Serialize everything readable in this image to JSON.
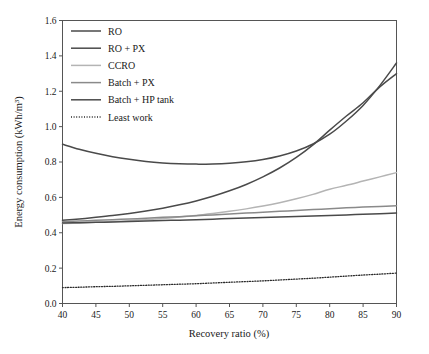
{
  "figure": {
    "background_color": "#ffffff",
    "frame_color": "#555555"
  },
  "chart_data": {
    "type": "line",
    "title": "",
    "xlabel": "Recovery ratio (%)",
    "ylabel": "Energy consumption (kWh/m",
    "ylabel_sup": "3",
    "ylabel_tail": ")",
    "xlim": [
      40,
      90
    ],
    "ylim": [
      0.0,
      1.6
    ],
    "xticks": [
      40,
      45,
      50,
      55,
      60,
      65,
      70,
      75,
      80,
      85,
      90
    ],
    "xtick_labels": [
      "40",
      "45",
      "50",
      "55",
      "60",
      "65",
      "70",
      "75",
      "80",
      "85",
      "90"
    ],
    "yticks": [
      0.0,
      0.2,
      0.4,
      0.6,
      0.8,
      1.0,
      1.2,
      1.4,
      1.6
    ],
    "ytick_labels": [
      "0.0",
      "0.2",
      "0.4",
      "0.6",
      "0.8",
      "1.0",
      "1.2",
      "1.4",
      "1.6"
    ],
    "grid": false,
    "legend_position": "upper-left",
    "x": [
      40,
      42.5,
      45,
      47.5,
      50,
      52.5,
      55,
      57.5,
      60,
      62.5,
      65,
      67.5,
      70,
      72.5,
      75,
      77.5,
      80,
      82.5,
      85,
      87.5,
      90
    ],
    "series": [
      {
        "name": "RO",
        "color": "#4a4a4a",
        "width": 1.5,
        "dash": "none",
        "values": [
          0.9,
          0.872,
          0.849,
          0.83,
          0.815,
          0.803,
          0.795,
          0.79,
          0.788,
          0.789,
          0.793,
          0.801,
          0.814,
          0.834,
          0.862,
          0.902,
          0.957,
          1.032,
          1.12,
          1.232,
          1.36
        ]
      },
      {
        "name": "RO + PX",
        "color": "#4a4a4a",
        "width": 1.5,
        "dash": "none",
        "values": [
          0.47,
          0.478,
          0.487,
          0.497,
          0.509,
          0.523,
          0.539,
          0.558,
          0.58,
          0.606,
          0.637,
          0.673,
          0.716,
          0.766,
          0.826,
          0.897,
          0.98,
          1.06,
          1.135,
          1.225,
          1.3
        ]
      },
      {
        "name": "CCRO",
        "color": "#b4b4b4",
        "width": 1.5,
        "dash": "none",
        "values": [
          0.452,
          0.455,
          0.459,
          0.463,
          0.468,
          0.474,
          0.481,
          0.489,
          0.498,
          0.509,
          0.521,
          0.535,
          0.551,
          0.57,
          0.592,
          0.617,
          0.646,
          0.668,
          0.692,
          0.716,
          0.74
        ]
      },
      {
        "name": "Batch + PX",
        "color": "#8a8a8a",
        "width": 1.5,
        "dash": "none",
        "values": [
          0.462,
          0.466,
          0.47,
          0.474,
          0.478,
          0.482,
          0.487,
          0.491,
          0.496,
          0.501,
          0.506,
          0.511,
          0.516,
          0.521,
          0.526,
          0.531,
          0.536,
          0.541,
          0.545,
          0.549,
          0.553
        ]
      },
      {
        "name": "Batch + HP tank",
        "color": "#4a4a4a",
        "width": 1.5,
        "dash": "none",
        "values": [
          0.455,
          0.457,
          0.459,
          0.461,
          0.464,
          0.466,
          0.469,
          0.471,
          0.474,
          0.477,
          0.48,
          0.483,
          0.486,
          0.489,
          0.492,
          0.495,
          0.498,
          0.501,
          0.505,
          0.508,
          0.512
        ]
      },
      {
        "name": "Least work",
        "color": "#2a2a2a",
        "width": 1.3,
        "dash": "1,1.6",
        "values": [
          0.09,
          0.092,
          0.095,
          0.097,
          0.1,
          0.103,
          0.106,
          0.109,
          0.112,
          0.116,
          0.12,
          0.124,
          0.128,
          0.133,
          0.138,
          0.143,
          0.149,
          0.155,
          0.161,
          0.166,
          0.172
        ]
      }
    ],
    "legend": [
      {
        "label": "RO",
        "color": "#4a4a4a",
        "dash": "none"
      },
      {
        "label": "RO + PX",
        "color": "#4a4a4a",
        "dash": "none"
      },
      {
        "label": "CCRO",
        "color": "#b4b4b4",
        "dash": "none"
      },
      {
        "label": "Batch + PX",
        "color": "#8a8a8a",
        "dash": "none"
      },
      {
        "label": "Batch + HP tank",
        "color": "#4a4a4a",
        "dash": "none"
      },
      {
        "label": "Least work",
        "color": "#2a2a2a",
        "dash": "1,1.6"
      }
    ]
  }
}
